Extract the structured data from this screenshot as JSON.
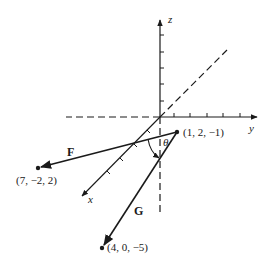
{
  "figure": {
    "colors": {
      "ink": "#1a1a1a",
      "background": "#ffffff"
    }
  },
  "axes": {
    "x_label": "x",
    "y_label": "y",
    "z_label": "z"
  },
  "points": {
    "origin_point": {
      "label": "(1, 2, −1)"
    },
    "f_end": {
      "label": "(7, −2, 2)"
    },
    "g_end": {
      "label": "(4, 0, −5)"
    }
  },
  "vectors": {
    "f": {
      "label": "F"
    },
    "g": {
      "label": "G"
    }
  },
  "angle": {
    "label": "θ"
  }
}
